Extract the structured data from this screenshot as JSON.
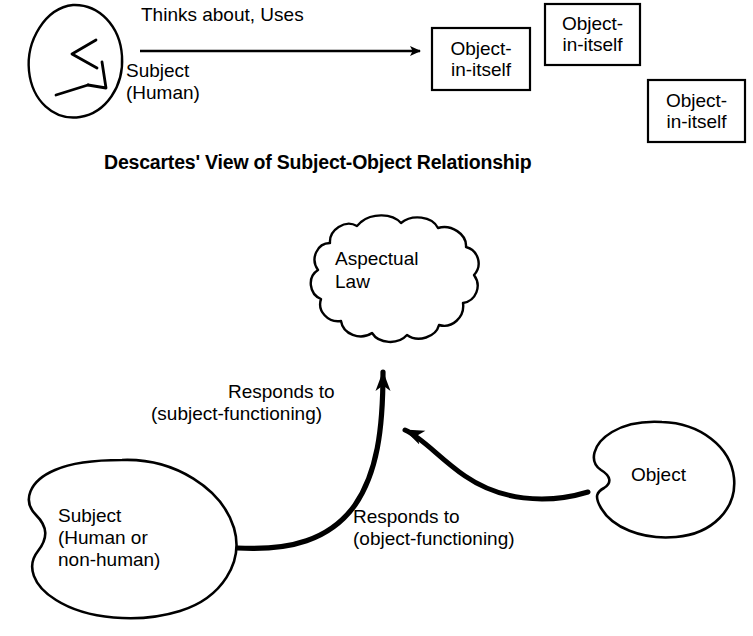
{
  "figure": {
    "kind": "conceptual-diagram",
    "background_color": "#ffffff",
    "stroke_color": "#000000"
  },
  "top_diagram": {
    "caption": "Descartes' View of Subject-Object Relationship",
    "subject": {
      "shape": "ellipse-with-notches",
      "label_line1": "Subject",
      "label_line2": "(Human)"
    },
    "relation_label": "Thinks about, Uses",
    "arrow": {
      "name": "thinks-about-arrow",
      "direction": "right"
    },
    "objects": [
      {
        "line1": "Object-",
        "line2": "in-itself"
      },
      {
        "line1": "Object-",
        "line2": "in-itself"
      },
      {
        "line1": "Object-",
        "line2": "in-itself"
      }
    ]
  },
  "bottom_diagram": {
    "law": {
      "shape": "cloud",
      "line1": "Aspectual",
      "line2": "Law"
    },
    "subject": {
      "shape": "blob",
      "line1": "Subject",
      "line2": "(Human or",
      "line3": "non-human)"
    },
    "object": {
      "shape": "blob",
      "label": "Object"
    },
    "subject_relation": {
      "line1": "Responds to",
      "line2": "(subject-functioning)"
    },
    "object_relation": {
      "line1": "Responds to",
      "line2": "(object-functioning)"
    }
  }
}
